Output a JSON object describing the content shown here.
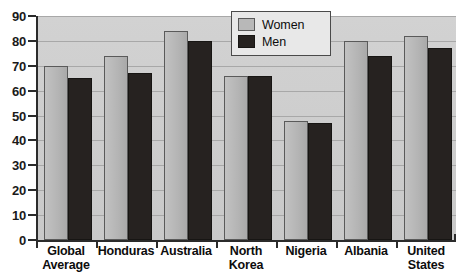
{
  "chart_data": {
    "type": "bar",
    "title": "",
    "subtitle": "",
    "xlabel": "",
    "ylabel": "",
    "ylim": [
      0,
      90
    ],
    "ytick_step": 10,
    "yticks": [
      0,
      10,
      20,
      30,
      40,
      50,
      60,
      70,
      80,
      90
    ],
    "grid": true,
    "grid_axis": "y",
    "legend_position": "top-center-right",
    "categories": [
      "Global Average",
      "Honduras",
      "Australia",
      "North Korea",
      "Nigeria",
      "Albania",
      "United States"
    ],
    "series": [
      {
        "name": "Women",
        "color": "#b8b8b8",
        "values": [
          70,
          74,
          84,
          66,
          48,
          80,
          82
        ]
      },
      {
        "name": "Men",
        "color": "#262220",
        "values": [
          65,
          67,
          80,
          66,
          47,
          74,
          77
        ]
      }
    ]
  },
  "legend": {
    "items": [
      {
        "label": "Women",
        "swatch": "women"
      },
      {
        "label": "Men",
        "swatch": "men"
      }
    ]
  },
  "colors": {
    "plot_background": "#cfcfcf",
    "women_bar": "#b8b8b8",
    "men_bar": "#262220",
    "axis": "#2b2b2b",
    "gridline": "#a8a8a8",
    "text": "#0d0d0d",
    "page_background": "#ffffff"
  }
}
